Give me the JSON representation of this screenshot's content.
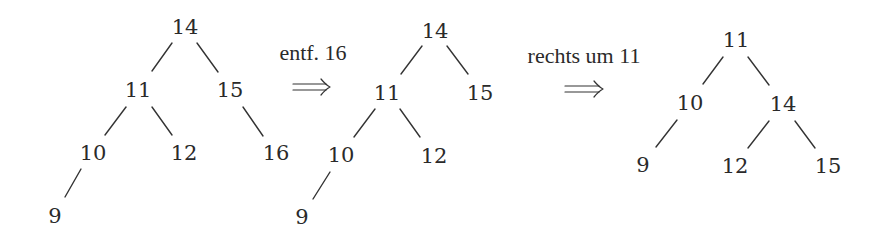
{
  "diagram": {
    "colors": {
      "ink": "#2a2a2a",
      "background": "#ffffff"
    },
    "trees": [
      {
        "id": "tree-initial",
        "nodes": [
          {
            "id": "n14",
            "label": "14",
            "x": 185,
            "y": 27
          },
          {
            "id": "n11",
            "label": "11",
            "x": 138,
            "y": 90
          },
          {
            "id": "n15",
            "label": "15",
            "x": 230,
            "y": 90
          },
          {
            "id": "n10",
            "label": "10",
            "x": 93,
            "y": 153
          },
          {
            "id": "n12",
            "label": "12",
            "x": 184,
            "y": 153
          },
          {
            "id": "n16",
            "label": "16",
            "x": 276,
            "y": 153
          },
          {
            "id": "n9",
            "label": "9",
            "x": 55,
            "y": 216
          }
        ],
        "edges": [
          {
            "from": "14",
            "to": "11",
            "x1": 172,
            "y1": 43,
            "x2": 152,
            "y2": 71
          },
          {
            "from": "14",
            "to": "15",
            "x1": 197,
            "y1": 43,
            "x2": 218,
            "y2": 72
          },
          {
            "from": "11",
            "to": "10",
            "x1": 126,
            "y1": 107,
            "x2": 105,
            "y2": 135
          },
          {
            "from": "11",
            "to": "12",
            "x1": 152,
            "y1": 107,
            "x2": 172,
            "y2": 135
          },
          {
            "from": "15",
            "to": "16",
            "x1": 243,
            "y1": 107,
            "x2": 263,
            "y2": 136
          },
          {
            "from": "10",
            "to": "9",
            "x1": 81,
            "y1": 169,
            "x2": 65,
            "y2": 197
          }
        ]
      },
      {
        "id": "tree-after-delete",
        "nodes": [
          {
            "id": "n14",
            "label": "14",
            "x": 435,
            "y": 31
          },
          {
            "id": "n11",
            "label": "11",
            "x": 387,
            "y": 93
          },
          {
            "id": "n15",
            "label": "15",
            "x": 480,
            "y": 93
          },
          {
            "id": "n10",
            "label": "10",
            "x": 341,
            "y": 155
          },
          {
            "id": "n12",
            "label": "12",
            "x": 434,
            "y": 156
          },
          {
            "id": "n9",
            "label": "9",
            "x": 302,
            "y": 217
          }
        ],
        "edges": [
          {
            "from": "14",
            "to": "11",
            "x1": 422,
            "y1": 46,
            "x2": 401,
            "y2": 74
          },
          {
            "from": "14",
            "to": "15",
            "x1": 447,
            "y1": 46,
            "x2": 468,
            "y2": 74
          },
          {
            "from": "11",
            "to": "10",
            "x1": 375,
            "y1": 109,
            "x2": 354,
            "y2": 137
          },
          {
            "from": "11",
            "to": "12",
            "x1": 400,
            "y1": 109,
            "x2": 420,
            "y2": 137
          },
          {
            "from": "10",
            "to": "9",
            "x1": 330,
            "y1": 172,
            "x2": 313,
            "y2": 199
          }
        ]
      },
      {
        "id": "tree-after-rotation",
        "nodes": [
          {
            "id": "n11",
            "label": "11",
            "x": 736,
            "y": 40
          },
          {
            "id": "n10",
            "label": "10",
            "x": 690,
            "y": 103
          },
          {
            "id": "n14",
            "label": "14",
            "x": 783,
            "y": 104
          },
          {
            "id": "n9",
            "label": "9",
            "x": 643,
            "y": 165
          },
          {
            "id": "n12",
            "label": "12",
            "x": 735,
            "y": 166
          },
          {
            "id": "n15",
            "label": "15",
            "x": 828,
            "y": 166
          }
        ],
        "edges": [
          {
            "from": "11",
            "to": "10",
            "x1": 723,
            "y1": 57,
            "x2": 703,
            "y2": 84
          },
          {
            "from": "11",
            "to": "14",
            "x1": 748,
            "y1": 57,
            "x2": 769,
            "y2": 85
          },
          {
            "from": "10",
            "to": "9",
            "x1": 677,
            "y1": 120,
            "x2": 656,
            "y2": 147
          },
          {
            "from": "14",
            "to": "12",
            "x1": 769,
            "y1": 121,
            "x2": 748,
            "y2": 148
          },
          {
            "from": "14",
            "to": "15",
            "x1": 795,
            "y1": 121,
            "x2": 815,
            "y2": 148
          }
        ]
      }
    ],
    "transitions": [
      {
        "id": "step-delete",
        "label": "entf. 16",
        "label_x": 313,
        "label_y": 60,
        "arrow_x1": 293,
        "arrow_x2": 330,
        "arrow_y": 87
      },
      {
        "id": "step-rotate",
        "label": "rechts um 11",
        "label_x": 584,
        "label_y": 63,
        "arrow_x1": 565,
        "arrow_x2": 603,
        "arrow_y": 89
      }
    ]
  }
}
